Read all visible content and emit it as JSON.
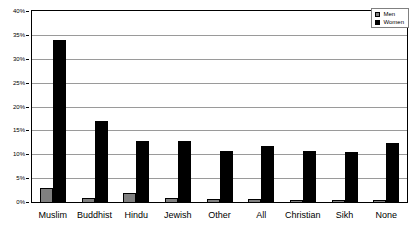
{
  "chart_data": {
    "type": "bar",
    "title": "",
    "subtitle": "",
    "xlabel": "",
    "ylabel": "",
    "categories": [
      "Muslim",
      "Buddhist",
      "Hindu",
      "Jewish",
      "Other",
      "All",
      "Christian",
      "Sikh",
      "None"
    ],
    "series": [
      {
        "name": "Men",
        "color": "#808080",
        "values": [
          3.0,
          0.9,
          1.8,
          0.8,
          0.7,
          0.6,
          0.5,
          0.5,
          0.4
        ]
      },
      {
        "name": "Women",
        "color": "#000000",
        "values": [
          34.0,
          16.9,
          12.8,
          12.8,
          10.7,
          11.7,
          10.6,
          10.5,
          12.4
        ]
      }
    ],
    "ylim": [
      0,
      40
    ],
    "ytick_values": [
      0,
      5,
      10,
      15,
      20,
      25,
      30,
      35,
      40
    ],
    "ytick_labels": [
      "0%",
      "5%",
      "10%",
      "15%",
      "20%",
      "25%",
      "30%",
      "35%",
      "40%"
    ],
    "grid": true,
    "grid_axis": "y",
    "legend_position": "top-right",
    "annotations": []
  },
  "legend": {
    "items": [
      {
        "label": "Men",
        "swatch": "legend-swatch-men"
      },
      {
        "label": "Women",
        "swatch": "legend-swatch-women"
      }
    ]
  }
}
